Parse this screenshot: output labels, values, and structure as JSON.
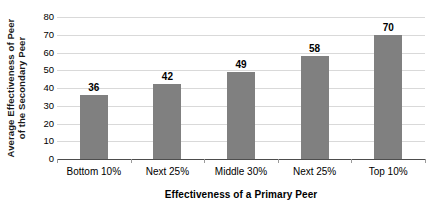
{
  "chart_data": {
    "type": "bar",
    "title": "",
    "categories": [
      "Bottom 10%",
      "Next 25%",
      "Middle 30%",
      "Next 25%",
      "Top 10%"
    ],
    "values": [
      36,
      42,
      49,
      58,
      70
    ],
    "data_labels": [
      "36",
      "42",
      "49",
      "58",
      "70"
    ],
    "xlabel": "Effectiveness of a Primary Peer",
    "ylabel_line1": "Average Effectiveness of Peer",
    "ylabel_line2": "of the Secondary Peer",
    "ylim": [
      0,
      80
    ],
    "yticks": [
      80,
      70,
      60,
      50,
      40,
      30,
      20,
      10,
      0
    ],
    "ytick_labels": [
      "80",
      "70",
      "60",
      "50",
      "40",
      "30",
      "20",
      "10",
      "0"
    ],
    "grid": true,
    "grid_axis": "y",
    "legend": false,
    "legend_position": "none",
    "bar_color": "#808080",
    "gridline_color": "#d9d9d9",
    "axis_color": "#4d4d4d",
    "background_color": "#ffffff"
  }
}
